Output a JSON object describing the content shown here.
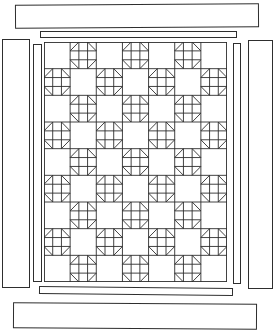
{
  "diagram": {
    "kind": "quilt-assembly-diagram",
    "background_color": "#ffffff",
    "ink_color": "#2e2e2e",
    "panel": {
      "rows": 9,
      "cols": 7,
      "layout": "checkerboard",
      "top_left_cell": "plain",
      "pieced_cell_rule": "pieced where (row + col) is odd, 1-indexed",
      "pieced_block_count": 31,
      "plain_block_count": 32,
      "pieced_block": {
        "name": "pieced-block",
        "structure": "3x3 grid with four corner triangles forming an octagon outline"
      }
    },
    "border_strips": {
      "outer": [
        "top",
        "bottom",
        "left",
        "right"
      ],
      "inner": [
        "top",
        "bottom",
        "left",
        "right"
      ]
    }
  }
}
